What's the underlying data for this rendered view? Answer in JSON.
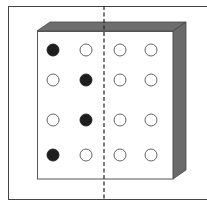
{
  "diagram": {
    "colors": {
      "outline": "#333333",
      "box_top": "#6e6e6e",
      "box_side": "#6a6a6a",
      "front_face": "#ffffff",
      "filled_circle": "#1e1e1e",
      "empty_circle": "#ffffff"
    },
    "grid": {
      "rows": 4,
      "cols": 4,
      "cells": [
        [
          "filled",
          "empty",
          "empty",
          "empty"
        ],
        [
          "empty",
          "filled",
          "empty",
          "empty"
        ],
        [
          "empty",
          "filled",
          "empty",
          "empty"
        ],
        [
          "filled",
          "empty",
          "empty",
          "empty"
        ]
      ]
    },
    "fold_line": {
      "style": "dashed",
      "orientation": "vertical"
    }
  }
}
